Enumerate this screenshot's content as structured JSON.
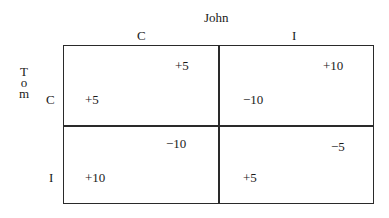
{
  "column_player": {
    "name": "John",
    "strategies": [
      "C",
      "I"
    ]
  },
  "row_player": {
    "name": "Tom",
    "letters": [
      "T",
      "o",
      "m"
    ],
    "strategies": [
      "C",
      "I"
    ]
  },
  "payoffs": {
    "CC": {
      "john": "+5",
      "tom": "+5"
    },
    "CI": {
      "john": "+10",
      "tom": "−10"
    },
    "IC": {
      "john": "−10",
      "tom": "+10"
    },
    "II": {
      "john": "−5",
      "tom": "+5"
    }
  }
}
